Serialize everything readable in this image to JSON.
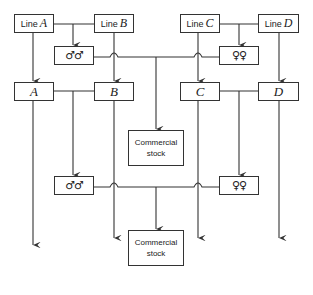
{
  "diagram": {
    "type": "breeding-scheme",
    "top_lines": [
      {
        "prefix": "Line",
        "letter": "A"
      },
      {
        "prefix": "Line",
        "letter": "B"
      },
      {
        "prefix": "Line",
        "letter": "C"
      },
      {
        "prefix": "Line",
        "letter": "D"
      }
    ],
    "mid_lines": [
      "A",
      "B",
      "C",
      "D"
    ],
    "male_symbol": "♂♂",
    "female_symbol": "♀♀",
    "commercial_stock_1": {
      "line1": "Commercial",
      "line2": "stock"
    },
    "commercial_stock_2": {
      "line1": "Commercial",
      "line2": "stock"
    },
    "line_color": "#333333"
  }
}
